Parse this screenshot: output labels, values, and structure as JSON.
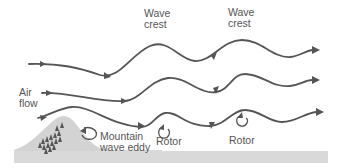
{
  "diagram": {
    "title": "",
    "labels": {
      "wave_crest_1": "Wave\ncrest",
      "wave_crest_2": "Wave\ncrest",
      "air_flow": "Air\nflow",
      "mountain_wave_eddy": "Mountain\nwave eddy",
      "rotor_1": "Rotor",
      "rotor_2": "Rotor"
    },
    "colors": {
      "flow_line": "#555555",
      "mountain": "#d3d3d3",
      "ground": "#d9d9d9",
      "trees": "#555555",
      "text": "#555555"
    },
    "elements": {
      "flow_lines": 3,
      "rotors": 2,
      "eddies": 1
    }
  }
}
